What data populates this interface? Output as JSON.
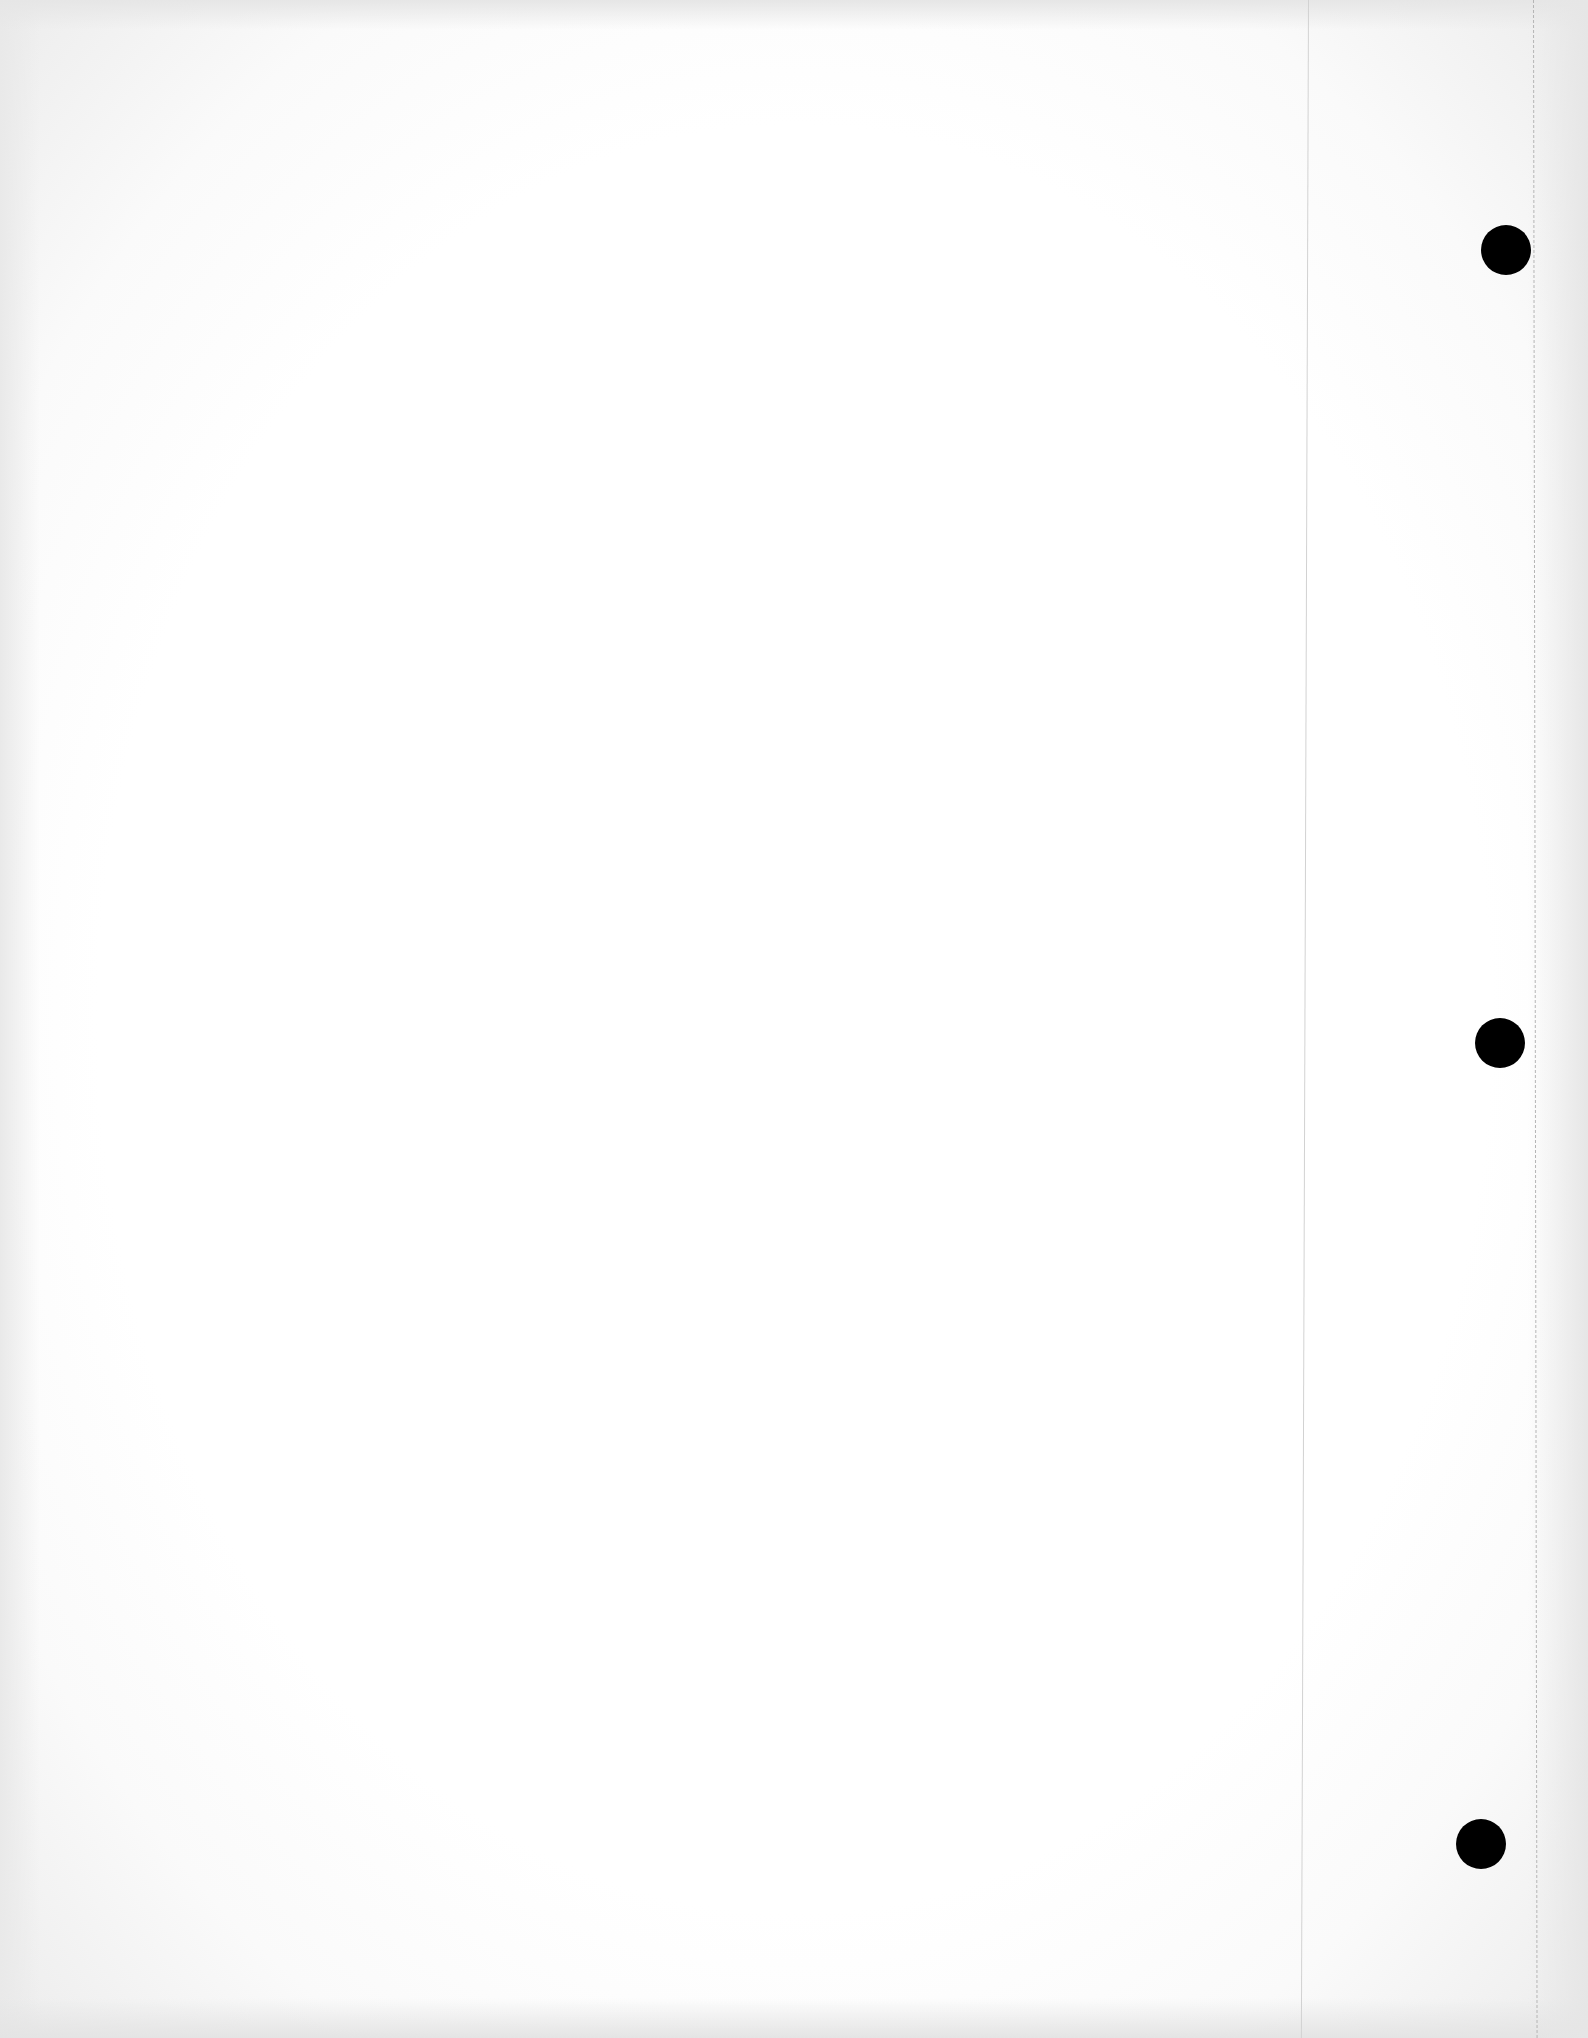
{
  "page": {
    "type": "blank loose-leaf sheet",
    "text_content": "",
    "paper_color": "#ffffff",
    "hole_color": "#000000",
    "holes": [
      {
        "label": "top-hole",
        "cx": 1506,
        "cy": 250,
        "r": 25
      },
      {
        "label": "middle-hole",
        "cx": 1500,
        "cy": 1043,
        "r": 25
      },
      {
        "label": "bottom-hole",
        "cx": 1481,
        "cy": 1844,
        "r": 25
      }
    ]
  }
}
